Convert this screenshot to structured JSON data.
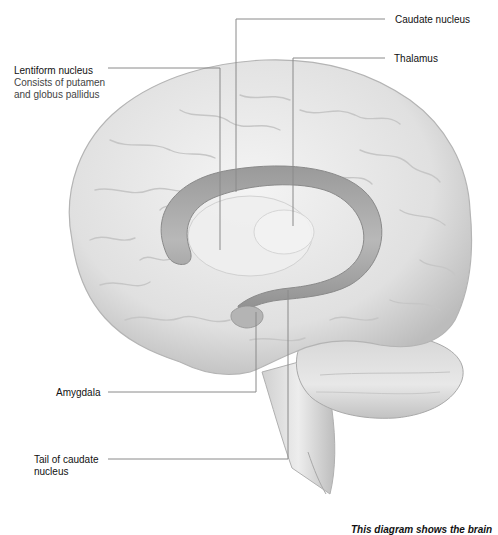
{
  "diagram": {
    "colors": {
      "background": "#ffffff",
      "brain_fill": "#e6e6e6",
      "brain_shade": "#bdbdbd",
      "caudate_fill": "#a8a8a8",
      "leader_line": "#8a8a8a",
      "text": "#1a1a1a"
    }
  },
  "labels": {
    "lentiform": {
      "title": "Lentiform nucleus",
      "line1": "Consists of putamen",
      "line2": "and globus pallidus"
    },
    "caudate": {
      "title": "Caudate nucleus"
    },
    "thalamus": {
      "title": "Thalamus"
    },
    "amygdala": {
      "title": "Amygdala"
    },
    "tail": {
      "line1": "Tail of caudate",
      "line2": "nucleus"
    }
  },
  "caption": {
    "text": "This diagram shows the brain"
  }
}
